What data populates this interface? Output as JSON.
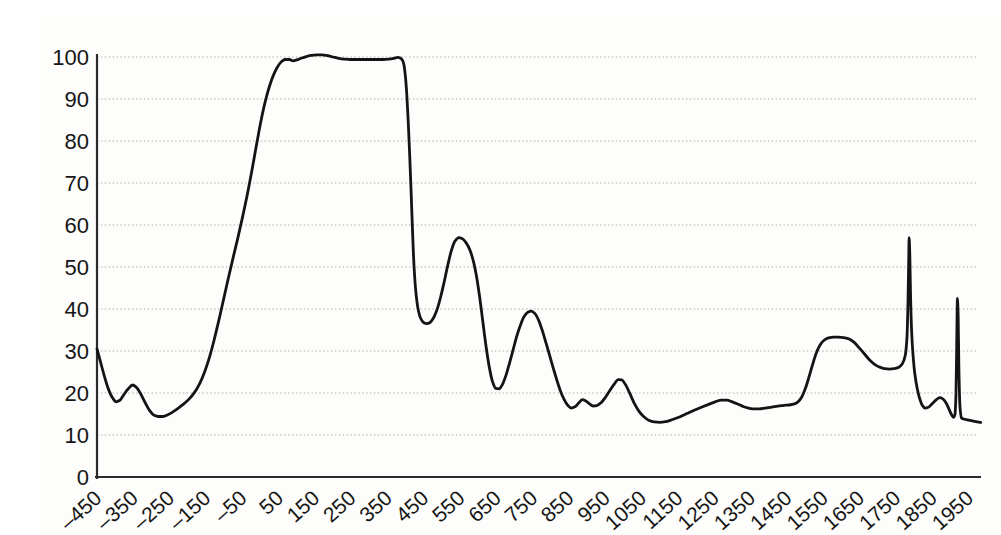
{
  "chart_data": {
    "type": "line",
    "xlim": [
      -450,
      1990
    ],
    "ylim": [
      0,
      100
    ],
    "grid": "horizontal-dotted",
    "legend": "none",
    "line_color": "#141414",
    "grid_color": "#9e9e9e",
    "axis_color": "#2b2b2b",
    "tick_label_color": "#161616",
    "background_color": "#fdfdfb",
    "x_ticks": [
      -450,
      -350,
      -250,
      -150,
      -50,
      50,
      150,
      250,
      350,
      450,
      550,
      650,
      750,
      850,
      950,
      1050,
      1150,
      1250,
      1350,
      1450,
      1550,
      1650,
      1750,
      1850,
      1950
    ],
    "x_tick_labels": [
      "–450",
      "–350",
      "–250",
      "–150",
      "–50",
      "50",
      "150",
      "250",
      "350",
      "450",
      "550",
      "650",
      "750",
      "850",
      "950",
      "1050",
      "1150",
      "1250",
      "1350",
      "1450",
      "1550",
      "1650",
      "1750",
      "1850",
      "1950"
    ],
    "y_ticks": [
      0,
      10,
      20,
      30,
      40,
      50,
      60,
      70,
      80,
      90,
      100
    ],
    "y_tick_labels": [
      "0",
      "10",
      "20",
      "30",
      "40",
      "50",
      "60",
      "70",
      "80",
      "90",
      "100"
    ],
    "series": [
      {
        "name": "curve",
        "points": [
          [
            -450,
            30.5
          ],
          [
            -440,
            27.3
          ],
          [
            -429,
            23.8
          ],
          [
            -418,
            20.8
          ],
          [
            -407,
            18.8
          ],
          [
            -397,
            17.9
          ],
          [
            -388,
            18.2
          ],
          [
            -377,
            19.5
          ],
          [
            -364,
            21.0
          ],
          [
            -352,
            21.9
          ],
          [
            -342,
            21.4
          ],
          [
            -331,
            20.0
          ],
          [
            -318,
            17.8
          ],
          [
            -305,
            15.8
          ],
          [
            -293,
            14.7
          ],
          [
            -281,
            14.4
          ],
          [
            -268,
            14.4
          ],
          [
            -255,
            14.8
          ],
          [
            -241,
            15.5
          ],
          [
            -226,
            16.4
          ],
          [
            -211,
            17.4
          ],
          [
            -196,
            18.6
          ],
          [
            -181,
            20.2
          ],
          [
            -167,
            22.3
          ],
          [
            -153,
            25.2
          ],
          [
            -140,
            28.6
          ],
          [
            -127,
            32.8
          ],
          [
            -114,
            37.5
          ],
          [
            -101,
            42.5
          ],
          [
            -88,
            47.5
          ],
          [
            -75,
            52.3
          ],
          [
            -62,
            57.0
          ],
          [
            -49,
            62.0
          ],
          [
            -36,
            67.3
          ],
          [
            -23,
            73.2
          ],
          [
            -10,
            79.5
          ],
          [
            2,
            85.0
          ],
          [
            13,
            89.3
          ],
          [
            24,
            92.8
          ],
          [
            35,
            95.5
          ],
          [
            46,
            97.5
          ],
          [
            57,
            98.8
          ],
          [
            68,
            99.4
          ],
          [
            80,
            99.4
          ],
          [
            90,
            99.1
          ],
          [
            100,
            99.3
          ],
          [
            112,
            99.7
          ],
          [
            126,
            100.1
          ],
          [
            140,
            100.4
          ],
          [
            155,
            100.5
          ],
          [
            170,
            100.5
          ],
          [
            185,
            100.3
          ],
          [
            200,
            100.0
          ],
          [
            215,
            99.7
          ],
          [
            230,
            99.5
          ],
          [
            248,
            99.4
          ],
          [
            266,
            99.4
          ],
          [
            284,
            99.4
          ],
          [
            302,
            99.4
          ],
          [
            320,
            99.4
          ],
          [
            338,
            99.4
          ],
          [
            354,
            99.5
          ],
          [
            368,
            99.7
          ],
          [
            378,
            99.9
          ],
          [
            384,
            99.8
          ],
          [
            390,
            99.4
          ],
          [
            395,
            98.2
          ],
          [
            399,
            95.5
          ],
          [
            403,
            91.0
          ],
          [
            407,
            84.5
          ],
          [
            411,
            76.5
          ],
          [
            415,
            67.5
          ],
          [
            419,
            58.0
          ],
          [
            423,
            50.0
          ],
          [
            428,
            44.0
          ],
          [
            434,
            40.0
          ],
          [
            441,
            37.8
          ],
          [
            449,
            36.8
          ],
          [
            458,
            36.5
          ],
          [
            467,
            36.8
          ],
          [
            476,
            37.8
          ],
          [
            486,
            39.8
          ],
          [
            496,
            42.8
          ],
          [
            506,
            46.5
          ],
          [
            516,
            50.5
          ],
          [
            526,
            54.0
          ],
          [
            536,
            56.2
          ],
          [
            546,
            57.0
          ],
          [
            556,
            56.7
          ],
          [
            566,
            55.8
          ],
          [
            576,
            54.2
          ],
          [
            585,
            51.8
          ],
          [
            594,
            48.2
          ],
          [
            603,
            43.2
          ],
          [
            612,
            37.2
          ],
          [
            621,
            31.2
          ],
          [
            630,
            26.2
          ],
          [
            639,
            22.7
          ],
          [
            648,
            21.1
          ],
          [
            657,
            21.0
          ],
          [
            666,
            22.0
          ],
          [
            676,
            24.2
          ],
          [
            686,
            27.2
          ],
          [
            696,
            30.4
          ],
          [
            706,
            33.6
          ],
          [
            716,
            36.2
          ],
          [
            726,
            38.2
          ],
          [
            736,
            39.2
          ],
          [
            746,
            39.5
          ],
          [
            756,
            38.9
          ],
          [
            766,
            37.3
          ],
          [
            776,
            34.9
          ],
          [
            786,
            32.0
          ],
          [
            796,
            29.0
          ],
          [
            806,
            26.0
          ],
          [
            816,
            23.1
          ],
          [
            826,
            20.5
          ],
          [
            836,
            18.5
          ],
          [
            846,
            17.1
          ],
          [
            856,
            16.4
          ],
          [
            866,
            16.7
          ],
          [
            876,
            17.6
          ],
          [
            886,
            18.4
          ],
          [
            896,
            18.1
          ],
          [
            906,
            17.4
          ],
          [
            916,
            16.9
          ],
          [
            926,
            17.0
          ],
          [
            938,
            17.7
          ],
          [
            950,
            19.0
          ],
          [
            962,
            20.6
          ],
          [
            974,
            22.1
          ],
          [
            985,
            23.2
          ],
          [
            995,
            23.1
          ],
          [
            1005,
            22.0
          ],
          [
            1017,
            19.9
          ],
          [
            1029,
            17.6
          ],
          [
            1042,
            15.7
          ],
          [
            1055,
            14.4
          ],
          [
            1069,
            13.5
          ],
          [
            1084,
            13.1
          ],
          [
            1100,
            13.0
          ],
          [
            1117,
            13.2
          ],
          [
            1135,
            13.7
          ],
          [
            1154,
            14.3
          ],
          [
            1174,
            15.1
          ],
          [
            1194,
            15.9
          ],
          [
            1214,
            16.6
          ],
          [
            1234,
            17.3
          ],
          [
            1252,
            17.9
          ],
          [
            1269,
            18.3
          ],
          [
            1284,
            18.3
          ],
          [
            1299,
            17.9
          ],
          [
            1314,
            17.4
          ],
          [
            1329,
            16.8
          ],
          [
            1344,
            16.4
          ],
          [
            1359,
            16.2
          ],
          [
            1374,
            16.2
          ],
          [
            1389,
            16.4
          ],
          [
            1404,
            16.6
          ],
          [
            1419,
            16.8
          ],
          [
            1434,
            17.0
          ],
          [
            1447,
            17.1
          ],
          [
            1459,
            17.2
          ],
          [
            1470,
            17.4
          ],
          [
            1480,
            17.9
          ],
          [
            1490,
            19.0
          ],
          [
            1500,
            21.0
          ],
          [
            1510,
            23.7
          ],
          [
            1520,
            26.7
          ],
          [
            1530,
            29.4
          ],
          [
            1540,
            31.3
          ],
          [
            1551,
            32.5
          ],
          [
            1564,
            33.1
          ],
          [
            1578,
            33.3
          ],
          [
            1592,
            33.3
          ],
          [
            1606,
            33.2
          ],
          [
            1620,
            32.9
          ],
          [
            1634,
            32.1
          ],
          [
            1648,
            30.8
          ],
          [
            1662,
            29.4
          ],
          [
            1676,
            28.0
          ],
          [
            1690,
            26.9
          ],
          [
            1704,
            26.2
          ],
          [
            1718,
            25.8
          ],
          [
            1732,
            25.7
          ],
          [
            1745,
            25.8
          ],
          [
            1757,
            26.1
          ],
          [
            1767,
            26.9
          ],
          [
            1775,
            28.8
          ],
          [
            1780,
            33.0
          ],
          [
            1783,
            42.0
          ],
          [
            1785,
            52.0
          ],
          [
            1786,
            57.0
          ],
          [
            1788,
            52.5
          ],
          [
            1790,
            43.0
          ],
          [
            1793,
            34.5
          ],
          [
            1797,
            28.8
          ],
          [
            1802,
            24.4
          ],
          [
            1808,
            21.2
          ],
          [
            1815,
            18.7
          ],
          [
            1822,
            17.1
          ],
          [
            1830,
            16.4
          ],
          [
            1839,
            16.6
          ],
          [
            1850,
            17.5
          ],
          [
            1861,
            18.4
          ],
          [
            1870,
            18.9
          ],
          [
            1879,
            18.6
          ],
          [
            1888,
            17.6
          ],
          [
            1896,
            16.1
          ],
          [
            1903,
            14.8
          ],
          [
            1908,
            14.2
          ],
          [
            1912,
            14.8
          ],
          [
            1915,
            19.5
          ],
          [
            1917,
            31.0
          ],
          [
            1919,
            42.5
          ],
          [
            1921,
            38.5
          ],
          [
            1923,
            26.0
          ],
          [
            1926,
            16.8
          ],
          [
            1930,
            14.1
          ],
          [
            1936,
            13.8
          ],
          [
            1946,
            13.6
          ],
          [
            1958,
            13.4
          ],
          [
            1970,
            13.2
          ],
          [
            1983,
            13.0
          ]
        ]
      }
    ]
  }
}
